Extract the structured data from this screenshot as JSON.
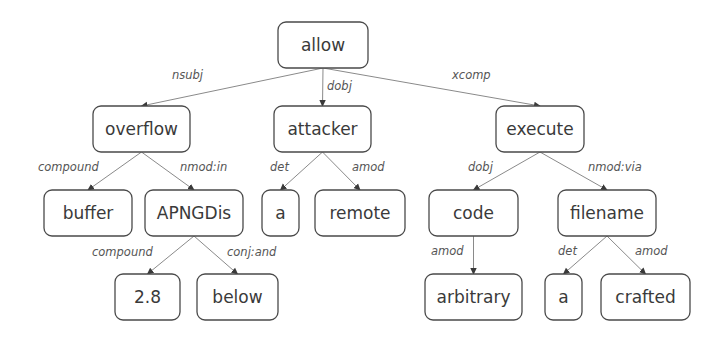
{
  "diagram": {
    "type": "dependency-parse-tree",
    "nodes": [
      {
        "id": "allow",
        "label": "allow",
        "x": 278,
        "y": 22,
        "w": 90,
        "h": 46
      },
      {
        "id": "overflow",
        "label": "overflow",
        "x": 93,
        "y": 106,
        "w": 97,
        "h": 46
      },
      {
        "id": "attacker",
        "label": "attacker",
        "x": 274,
        "y": 106,
        "w": 97,
        "h": 46
      },
      {
        "id": "execute",
        "label": "execute",
        "x": 496,
        "y": 106,
        "w": 88,
        "h": 46
      },
      {
        "id": "buffer",
        "label": "buffer",
        "x": 44,
        "y": 190,
        "w": 88,
        "h": 46
      },
      {
        "id": "APNGDis",
        "label": "APNGDis",
        "x": 145,
        "y": 190,
        "w": 98,
        "h": 46
      },
      {
        "id": "a1",
        "label": "a",
        "x": 262,
        "y": 190,
        "w": 37,
        "h": 46
      },
      {
        "id": "remote",
        "label": "remote",
        "x": 315,
        "y": 190,
        "w": 90,
        "h": 46
      },
      {
        "id": "code",
        "label": "code",
        "x": 429,
        "y": 190,
        "w": 89,
        "h": 46
      },
      {
        "id": "filename",
        "label": "filename",
        "x": 558,
        "y": 190,
        "w": 98,
        "h": 46
      },
      {
        "id": "n28",
        "label": "2.8",
        "x": 115,
        "y": 274,
        "w": 65,
        "h": 46
      },
      {
        "id": "below",
        "label": "below",
        "x": 197,
        "y": 274,
        "w": 81,
        "h": 46
      },
      {
        "id": "arbitrary",
        "label": "arbitrary",
        "x": 425,
        "y": 274,
        "w": 97,
        "h": 46
      },
      {
        "id": "a2",
        "label": "a",
        "x": 545,
        "y": 274,
        "w": 37,
        "h": 46
      },
      {
        "id": "crafted",
        "label": "crafted",
        "x": 601,
        "y": 274,
        "w": 89,
        "h": 46
      }
    ],
    "edges": [
      {
        "from": "allow",
        "to": "overflow",
        "label": "nsubj",
        "lx": 172,
        "ly": 79
      },
      {
        "from": "allow",
        "to": "attacker",
        "label": "dobj",
        "lx": 327,
        "ly": 90
      },
      {
        "from": "allow",
        "to": "execute",
        "label": "xcomp",
        "lx": 452,
        "ly": 79
      },
      {
        "from": "overflow",
        "to": "buffer",
        "label": "compound",
        "lx": 38,
        "ly": 171
      },
      {
        "from": "overflow",
        "to": "APNGDis",
        "label": "nmod:in",
        "lx": 180,
        "ly": 171
      },
      {
        "from": "attacker",
        "to": "a1",
        "label": "det",
        "lx": 270,
        "ly": 171
      },
      {
        "from": "attacker",
        "to": "remote",
        "label": "amod",
        "lx": 352,
        "ly": 171
      },
      {
        "from": "execute",
        "to": "code",
        "label": "dobj",
        "lx": 468,
        "ly": 171
      },
      {
        "from": "execute",
        "to": "filename",
        "label": "nmod:via",
        "lx": 588,
        "ly": 171
      },
      {
        "from": "APNGDis",
        "to": "n28",
        "label": "compound",
        "lx": 92,
        "ly": 256
      },
      {
        "from": "APNGDis",
        "to": "below",
        "label": "conj:and",
        "lx": 227,
        "ly": 256
      },
      {
        "from": "code",
        "to": "arbitrary",
        "label": "amod",
        "lx": 431,
        "ly": 255
      },
      {
        "from": "filename",
        "to": "a2",
        "label": "det",
        "lx": 558,
        "ly": 255
      },
      {
        "from": "filename",
        "to": "crafted",
        "label": "amod",
        "lx": 635,
        "ly": 255
      }
    ]
  },
  "colors": {
    "node_border": "#4a4a4a",
    "node_fill": "#ffffff",
    "node_text": "#3a3a3a",
    "edge": "#8a8a8a",
    "edge_label": "#555555",
    "background": "#ffffff"
  }
}
